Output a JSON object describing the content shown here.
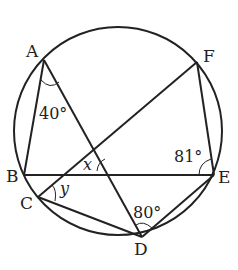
{
  "diagram": {
    "type": "circle-geometry",
    "points": {
      "A": {
        "label": "A",
        "x": 44,
        "y": 60
      },
      "B": {
        "label": "B",
        "x": 24,
        "y": 175
      },
      "C": {
        "label": "C",
        "x": 38,
        "y": 197
      },
      "D": {
        "label": "D",
        "x": 142,
        "y": 237
      },
      "E": {
        "label": "E",
        "x": 214,
        "y": 175
      },
      "F": {
        "label": "F",
        "x": 197,
        "y": 62
      }
    },
    "circle": {
      "cx": 118,
      "cy": 131,
      "r": 104
    },
    "segments": [
      "AB",
      "AD",
      "BE",
      "CF",
      "CD",
      "DE",
      "EF"
    ],
    "angles": {
      "angle_A": {
        "label": "40°",
        "vertex": "A"
      },
      "angle_E": {
        "label": "81°",
        "vertex": "E"
      },
      "angle_D": {
        "label": "80°",
        "vertex": "D"
      },
      "angle_x": {
        "label": "x",
        "vertex": "intersection of AD and CF"
      },
      "angle_y": {
        "label": "y",
        "vertex": "C"
      }
    },
    "colors": {
      "stroke": "#222222",
      "background": "#ffffff"
    }
  }
}
